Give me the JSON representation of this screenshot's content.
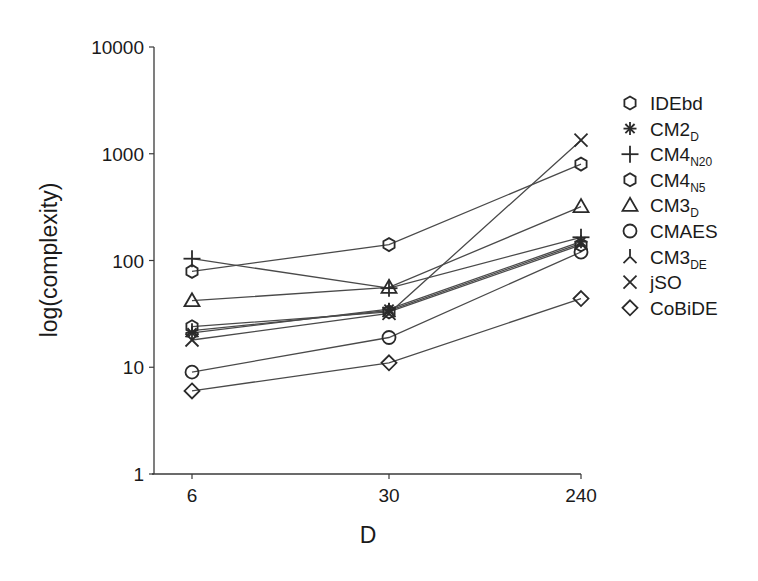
{
  "chart_data": {
    "type": "line",
    "title": "",
    "xlabel": "D",
    "ylabel": "log(complexity)",
    "x": [
      6,
      30,
      240
    ],
    "x_tick_labels": [
      "6",
      "30",
      "240"
    ],
    "y_scale": "log",
    "ylim": [
      1,
      10000
    ],
    "y_tick_labels": [
      "1",
      "10",
      "100",
      "1000",
      "10000"
    ],
    "grid": false,
    "legend_position": "right",
    "series": [
      {
        "name": "IDEbd",
        "base": "IDEbd",
        "sub": "",
        "marker": "hexagon",
        "values": [
          24,
          33,
          140
        ]
      },
      {
        "name": "CM2_D",
        "base": "CM2",
        "sub": "D",
        "marker": "asterisk",
        "values": [
          21,
          35,
          150
        ]
      },
      {
        "name": "CM4_N20",
        "base": "CM4",
        "sub": "N20",
        "marker": "plus",
        "values": [
          104,
          55,
          165
        ]
      },
      {
        "name": "CM4_N5",
        "base": "CM4",
        "sub": "N5",
        "marker": "hexagon",
        "values": [
          79,
          141,
          800
        ]
      },
      {
        "name": "CM3_D",
        "base": "CM3",
        "sub": "D",
        "marker": "triangle",
        "values": [
          42,
          56,
          320
        ]
      },
      {
        "name": "CMAES",
        "base": "CMAES",
        "sub": "",
        "marker": "circle",
        "values": [
          9,
          19,
          120
        ]
      },
      {
        "name": "CM3_DE",
        "base": "CM3",
        "sub": "DE",
        "marker": "tri-down",
        "values": [
          22,
          34,
          145
        ]
      },
      {
        "name": "jSO",
        "base": "jSO",
        "sub": "",
        "marker": "x",
        "values": [
          18,
          32,
          1340
        ]
      },
      {
        "name": "CoBiDE",
        "base": "CoBiDE",
        "sub": "",
        "marker": "diamond",
        "values": [
          6,
          11,
          44
        ]
      }
    ]
  }
}
